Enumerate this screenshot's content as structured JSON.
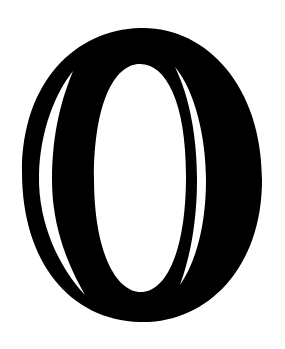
{
  "image": {
    "subject": "Decorative inline letter O",
    "letter": "O",
    "style": "inline serif display capital",
    "colors": {
      "background": "#ffffff",
      "ink": "#000000",
      "inline": "#ffffff"
    }
  }
}
